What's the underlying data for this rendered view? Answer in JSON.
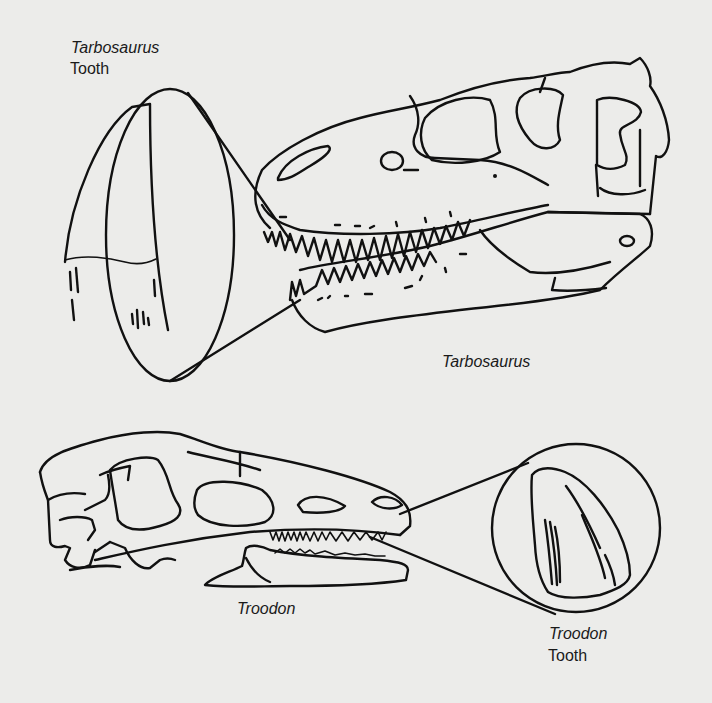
{
  "figure": {
    "tarbosaurus": {
      "tooth_label_genus": "Tarbosaurus",
      "tooth_label_word": "Tooth",
      "skull_label": "Tarbosaurus"
    },
    "troodon": {
      "tooth_label_genus": "Troodon",
      "tooth_label_word": "Tooth",
      "skull_label": "Troodon"
    },
    "colors": {
      "background": "#ececea",
      "line": "#111111"
    }
  }
}
